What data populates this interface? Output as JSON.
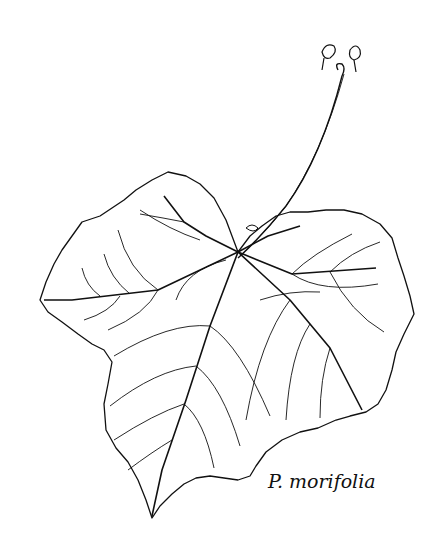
{
  "illustration": {
    "subject": "grape leaf line drawing",
    "caption": "P. morifolia",
    "stroke_color": "#111111",
    "background": "#ffffff"
  }
}
